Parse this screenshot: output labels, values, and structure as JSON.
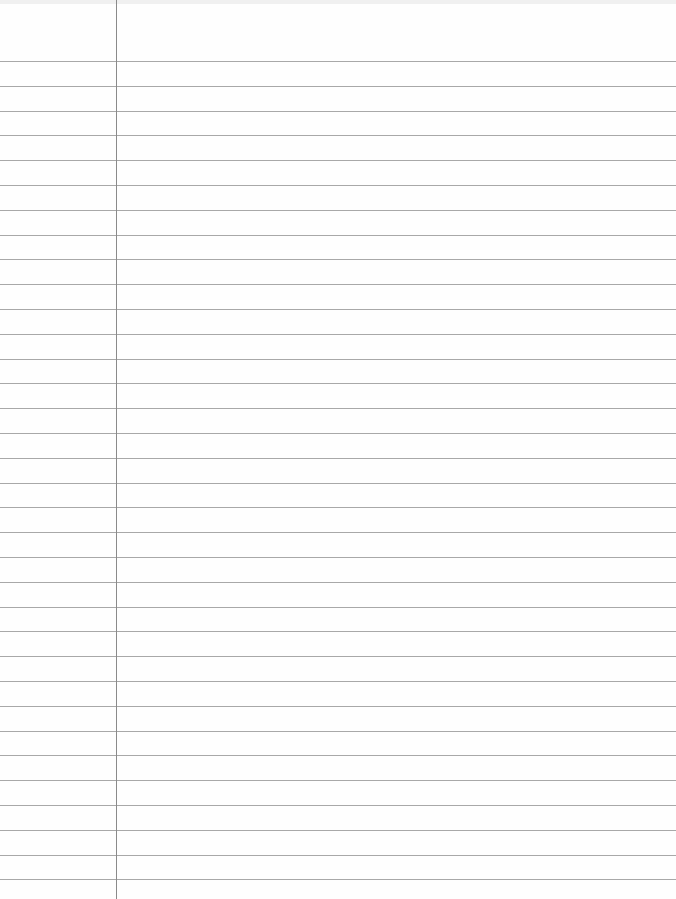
{
  "paper": {
    "type": "lined-notebook-page",
    "background_color": "#fefefe",
    "rule_color": "#a8a8a8",
    "margin_color": "#8a8a8a",
    "margin_x": 116,
    "first_rule_y": 61,
    "rule_spacing": 24.8,
    "rule_count": 34
  }
}
